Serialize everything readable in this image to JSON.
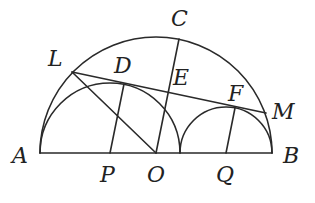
{
  "diagram": {
    "type": "geometry",
    "colors": {
      "stroke": "#2a2a2a",
      "label": "#222222",
      "background": "#ffffff"
    },
    "points": {
      "A": {
        "label": "A",
        "x": 40,
        "y": 153
      },
      "B": {
        "label": "B",
        "x": 272,
        "y": 153
      },
      "O": {
        "label": "O",
        "x": 156,
        "y": 153
      },
      "P": {
        "label": "P",
        "x": 110,
        "y": 153
      },
      "Q": {
        "label": "Q",
        "x": 226,
        "y": 153
      },
      "C": {
        "label": "C",
        "x": 179,
        "y": 39
      },
      "L": {
        "label": "L",
        "x": 72,
        "y": 72
      },
      "M": {
        "label": "M",
        "x": 266,
        "y": 113
      },
      "D": {
        "label": "D",
        "x": 124,
        "y": 84
      },
      "E": {
        "label": "E",
        "x": 167,
        "y": 92
      },
      "F": {
        "label": "F",
        "x": 235,
        "y": 108
      }
    },
    "circles": [
      {
        "name": "large-semicircle",
        "center": "O",
        "r": 116
      },
      {
        "name": "left-semicircle",
        "center": "P",
        "r": 70
      },
      {
        "name": "right-semicircle",
        "center": "Q",
        "r": 46
      }
    ],
    "segments": [
      [
        "A",
        "B"
      ],
      [
        "L",
        "M"
      ],
      [
        "O",
        "C"
      ],
      [
        "L",
        "O"
      ],
      [
        "P",
        "D"
      ],
      [
        "Q",
        "F"
      ]
    ]
  }
}
